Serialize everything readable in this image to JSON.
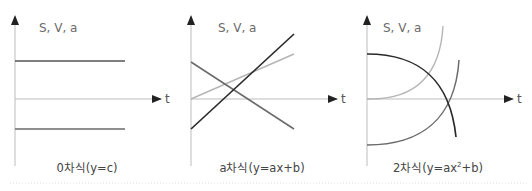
{
  "panels": [
    {
      "id": "zero-order",
      "y_axis_label": "S, V, a",
      "x_axis_label": "t",
      "caption": "0차식(y=c)",
      "curves": [
        {
          "name": "constant-high",
          "shade": "#555555",
          "kind": "line",
          "start": [
            0,
            1
          ],
          "end": [
            1,
            1
          ]
        },
        {
          "name": "constant-low",
          "shade": "#6a6a6a",
          "kind": "line",
          "start": [
            0,
            -0.8
          ],
          "end": [
            1,
            -0.8
          ]
        }
      ]
    },
    {
      "id": "first-order",
      "y_axis_label": "S, V, a",
      "x_axis_label": "t",
      "caption": "a차식(y=ax+b)",
      "curves": [
        {
          "name": "increasing-steep",
          "shade": "#2a2a2a",
          "kind": "line",
          "start": [
            0,
            -0.9
          ],
          "end": [
            1,
            2.0
          ]
        },
        {
          "name": "increasing-gentle",
          "shade": "#b5b5b5",
          "kind": "line",
          "start": [
            0,
            0
          ],
          "end": [
            1,
            1.4
          ]
        },
        {
          "name": "decreasing",
          "shade": "#6a6a6a",
          "kind": "line",
          "start": [
            0,
            1.1
          ],
          "end": [
            1,
            -0.9
          ]
        }
      ]
    },
    {
      "id": "second-order",
      "y_axis_label": "S, V, a",
      "x_axis_label": "t",
      "caption_main": "2차식(y=ax",
      "caption_sup": "2",
      "caption_tail": "+b)",
      "curves": [
        {
          "name": "parabola-down",
          "shade": "#2a2a2a",
          "kind": "quad"
        },
        {
          "name": "parabola-up-light",
          "shade": "#b5b5b5",
          "kind": "quad"
        },
        {
          "name": "parabola-up-mid",
          "shade": "#6a6a6a",
          "kind": "quad"
        }
      ]
    }
  ],
  "colors": {
    "axis": "#bdbdbd",
    "arrow": "#222222",
    "divider": "#d8d8d8"
  }
}
